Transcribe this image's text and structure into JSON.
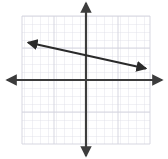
{
  "figure": {
    "title": "Coordinate plane with a linear graph",
    "background_color": "#ffffff",
    "width": 168,
    "height": 159
  },
  "grid": {
    "line_color": "#d8d8e2",
    "minor_line_color": "#e6e6ee",
    "cell_size_px": 8,
    "columns": 16,
    "rows": 16,
    "left_px": 22,
    "top_px": 16,
    "right_px": 150,
    "bottom_px": 144,
    "visible": true
  },
  "axes": {
    "color": "#3c3c3c",
    "stroke_width": 2.2,
    "origin_x_px": 86,
    "origin_y_px": 80,
    "x_axis": {
      "label": "x-axis",
      "start_px": 6,
      "end_px": 163,
      "arrow_both_ends": true
    },
    "y_axis": {
      "label": "y-axis",
      "start_px": 2,
      "end_px": 157,
      "arrow_both_ends": true
    },
    "tick_labels": [],
    "axis_labels_visible": false
  },
  "chart_data": {
    "type": "line",
    "title": "",
    "xlabel": "",
    "ylabel": "",
    "xlim": [
      -8,
      8
    ],
    "ylim": [
      -8,
      8
    ],
    "grid": true,
    "legend": null,
    "series": [
      {
        "name": "line",
        "color": "#2a2a2a",
        "stroke_width": 2.2,
        "arrow_start": true,
        "arrow_end": true,
        "slope": -0.22,
        "y_intercept": 1.9,
        "endpoints_graph_units": [
          {
            "x": -7.5,
            "y": 4.75
          },
          {
            "x": 7.75,
            "y": 1.38
          }
        ],
        "endpoints_px": [
          {
            "x": 26,
            "y": 42
          },
          {
            "x": 148,
            "y": 69
          }
        ],
        "points": [
          {
            "x": -7.5,
            "y": 4.75
          },
          {
            "x": 0,
            "y": 1.9
          },
          {
            "x": 7.75,
            "y": 1.38
          }
        ]
      }
    ]
  }
}
